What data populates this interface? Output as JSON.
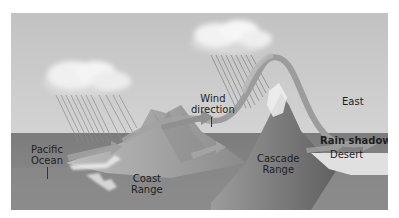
{
  "diagram": {
    "colors": {
      "sky_top": "#c4c4c4",
      "sky_bottom": "#dcdcdc",
      "ocean": "#7a7a7a",
      "land": "#8c8c8c",
      "mountain_light": "#b0b0b0",
      "mountain_dark": "#707070",
      "cascade": "#6e6e6e",
      "wind_arrow": "#9a9a9a",
      "cloud": "#f2f2f2",
      "rain": "#8a8a8a",
      "desert": "#e2e2e2",
      "label_text": "#1e1e1e"
    },
    "labels": {
      "pacific_ocean": [
        "Pacific",
        "Ocean"
      ],
      "wind_direction": [
        "Wind",
        "direction"
      ],
      "east": "East",
      "rain_shadow": "Rain shadow",
      "desert": "Desert",
      "coast_range": [
        "Coast",
        "Range"
      ],
      "cascade_range": [
        "Cascade",
        "Range"
      ]
    },
    "icons": {
      "cloud_left": "cloud-icon",
      "cloud_right": "cloud-icon",
      "rain_left": "rain-icon",
      "rain_right": "rain-icon",
      "wind_arrows": "arrow-right-icon"
    }
  }
}
